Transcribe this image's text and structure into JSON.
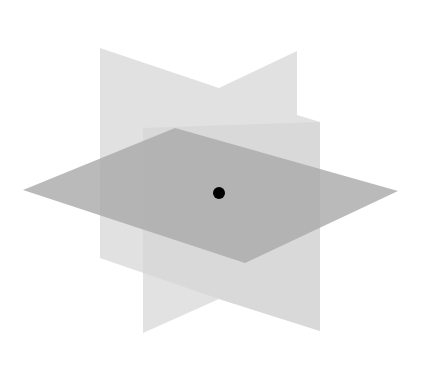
{
  "diagram": {
    "background": "#ffffff",
    "planes": [
      {
        "name": "vertical-plane-a",
        "points": "100,48 219,88 219,299 100,258",
        "fill": "#dcdcdc",
        "opacity": 0.85
      },
      {
        "name": "vertical-plane-b",
        "points": "219,88 297,51 297,115 320,122 320,331 219,299",
        "fill": "#dcdcdc",
        "opacity": 0.85
      },
      {
        "name": "vertical-plane-c",
        "points": "143,128 320,122 320,331 219,299 143,333",
        "fill": "#d6d6d6",
        "opacity": 0.7
      },
      {
        "name": "horizontal-plane",
        "points": "23,190 175,128 398,191 245,263",
        "fill": "#a9a9a9",
        "opacity": 0.8
      }
    ],
    "point": {
      "cx": 219,
      "cy": 193,
      "r": 6,
      "fill": "#000000"
    }
  }
}
